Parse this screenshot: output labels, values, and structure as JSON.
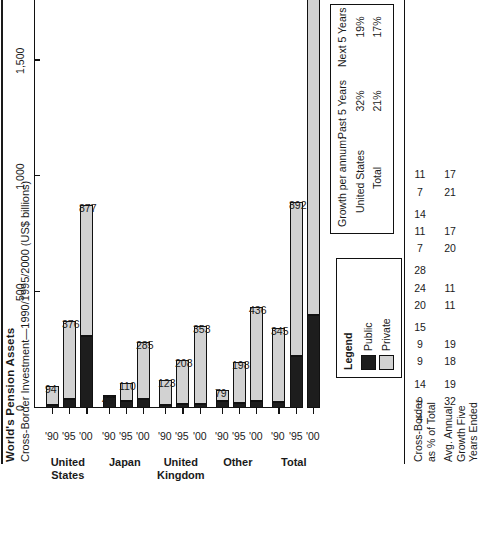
{
  "header": {
    "title": "World's Pension Assets",
    "subtitle": "Cross-Border Investment—1990/1995/2000 (US$ billions)"
  },
  "legend": {
    "title": "Legend",
    "items": [
      {
        "label": "Public",
        "color": "#1d1d1d"
      },
      {
        "label": "Private",
        "color": "#d2d2d2"
      }
    ]
  },
  "growth_box": {
    "header_label": "Growth per annum:",
    "col1": "Past 5 Years",
    "col2": "Next 5 Years",
    "rows": [
      {
        "label": "United States",
        "past": "32%",
        "next": "19%"
      },
      {
        "label": "Total",
        "past": "21%",
        "next": "17%"
      }
    ]
  },
  "annotations": {
    "row1_label": "Cross-Border\nas % of Total",
    "row2_label": "Avg. Annual\nGrowth Five\nYears Ended",
    "row1_values": [
      "4",
      "9",
      "14",
      "9",
      "9",
      "15",
      "20",
      "24",
      "28",
      "7",
      "11",
      "14",
      "7",
      "11"
    ],
    "row2_values": [
      "",
      "32",
      "19",
      "18",
      "19",
      "",
      "11",
      "11",
      "",
      "20",
      "17",
      "",
      "21",
      "17"
    ]
  },
  "chart_data": {
    "type": "bar",
    "orientation": "horizontal-stacked",
    "title": "World's Pension Assets",
    "subtitle": "Cross-Border Investment—1990/1995/2000 (US$ billions)",
    "xlabel": "",
    "ylabel": "US$ billions",
    "ylim": [
      0,
      2000
    ],
    "yticks": [
      0,
      500,
      1000,
      1500,
      2000
    ],
    "ytick_labels": [
      "0",
      "500",
      "1,000",
      "1,500",
      "2,000"
    ],
    "grid": false,
    "legend_position": "inside-left",
    "series": [
      {
        "name": "Public",
        "color": "#1d1d1d"
      },
      {
        "name": "Private",
        "color": "#d2d2d2"
      }
    ],
    "groups": [
      {
        "name": "United\nStates",
        "categories": [
          "'90",
          "'95",
          "'00"
        ]
      },
      {
        "name": "Japan",
        "categories": [
          "'90",
          "'95",
          "'00"
        ]
      },
      {
        "name": "United\nKingdom",
        "categories": [
          "'90",
          "'95",
          "'00"
        ]
      },
      {
        "name": "Other",
        "categories": [
          "'90",
          "'95",
          "'00"
        ]
      },
      {
        "name": "Total",
        "categories": [
          "'90",
          "'95",
          "'00"
        ]
      }
    ],
    "bars": [
      {
        "group": "United States",
        "year": "'90",
        "label": "94",
        "total": 94,
        "public": 12,
        "private": 82
      },
      {
        "group": "United States",
        "year": "'95",
        "label": "376",
        "total": 376,
        "public": 40,
        "private": 336
      },
      {
        "group": "United States",
        "year": "'00",
        "label": "877",
        "total": 877,
        "public": 310,
        "private": 567
      },
      {
        "group": "Japan",
        "year": "'90",
        "label": "49",
        "total": 49,
        "public": 46,
        "private": 3
      },
      {
        "group": "Japan",
        "year": "'95",
        "label": "110",
        "total": 110,
        "public": 30,
        "private": 80
      },
      {
        "group": "Japan",
        "year": "'00",
        "label": "285",
        "total": 285,
        "public": 38,
        "private": 247
      },
      {
        "group": "United Kingdom",
        "year": "'90",
        "label": "123",
        "total": 123,
        "public": 12,
        "private": 111
      },
      {
        "group": "United Kingdom",
        "year": "'95",
        "label": "208",
        "total": 208,
        "public": 16,
        "private": 192
      },
      {
        "group": "United Kingdom",
        "year": "'00",
        "label": "353",
        "total": 353,
        "public": 18,
        "private": 335
      },
      {
        "group": "Other",
        "year": "'90",
        "label": "79",
        "total": 79,
        "public": 30,
        "private": 49
      },
      {
        "group": "Other",
        "year": "'95",
        "label": "198",
        "total": 198,
        "public": 20,
        "private": 178
      },
      {
        "group": "Other",
        "year": "'00",
        "label": "436",
        "total": 436,
        "public": 30,
        "private": 406
      },
      {
        "group": "Total",
        "year": "'90",
        "label": "345",
        "total": 345,
        "public": 28,
        "private": 317
      },
      {
        "group": "Total",
        "year": "'95",
        "label": "892",
        "total": 892,
        "public": 225,
        "private": 667
      },
      {
        "group": "Total",
        "year": "'00",
        "label": "",
        "total": 1951,
        "public": 400,
        "private": 1551
      }
    ]
  }
}
